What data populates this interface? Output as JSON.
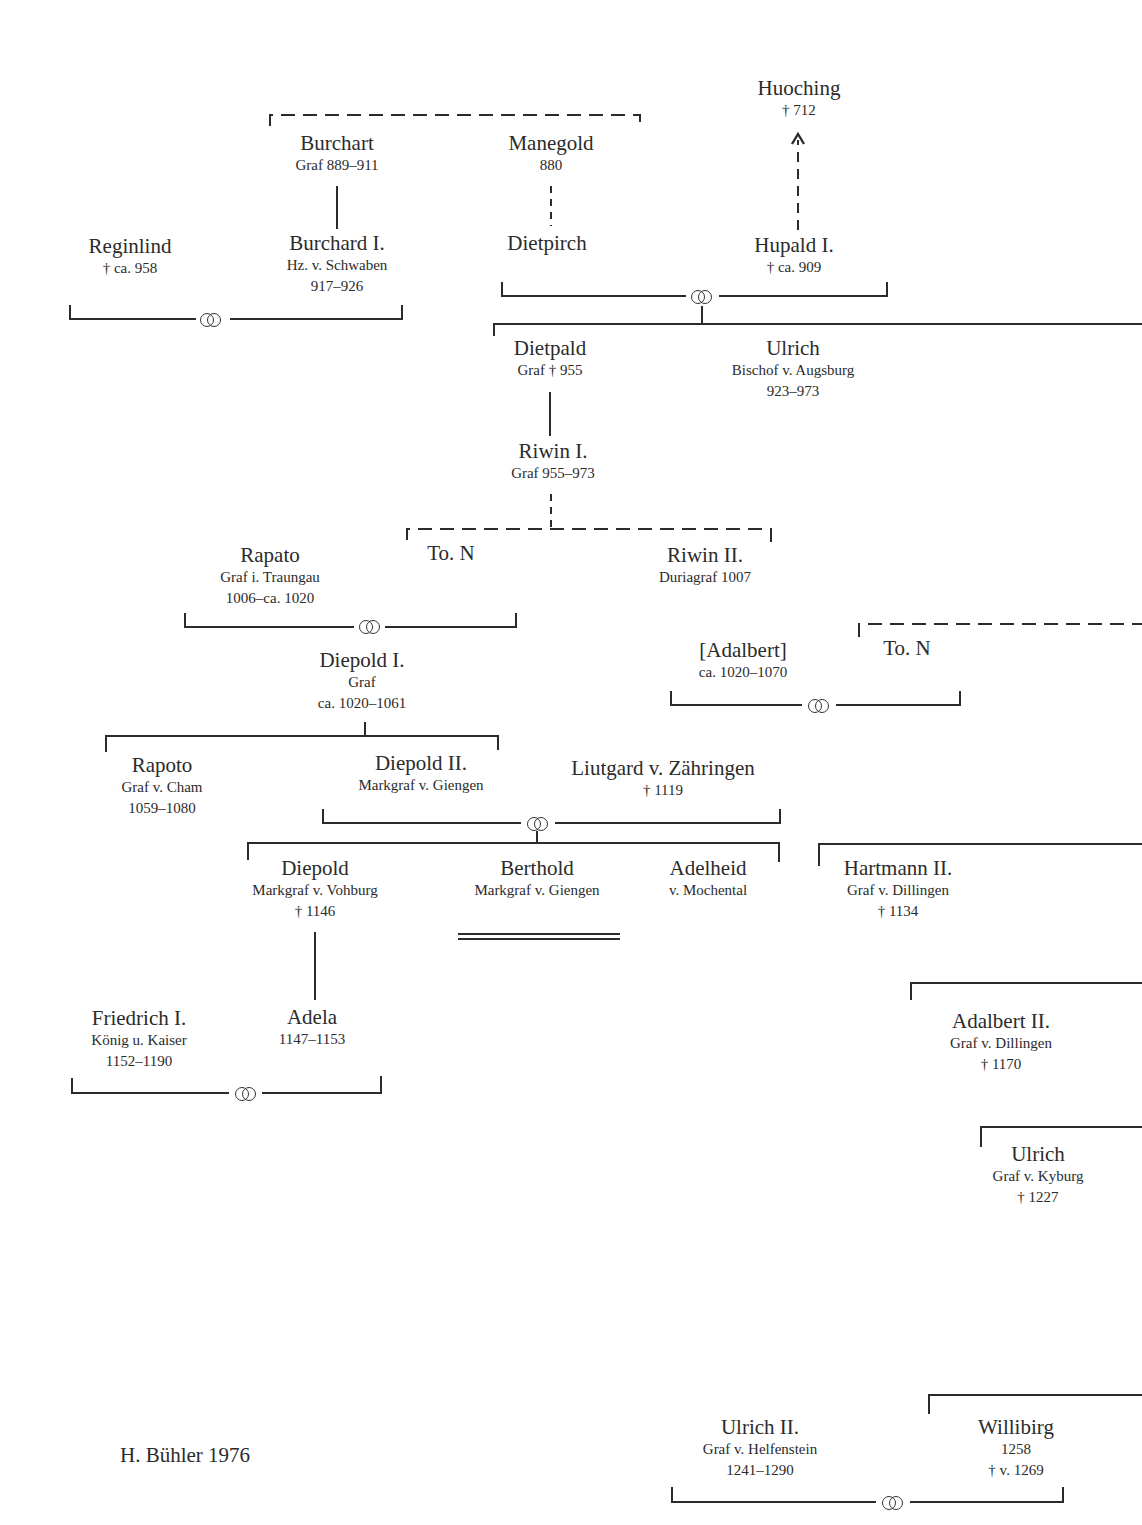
{
  "diagram": {
    "type": "genealogical-tree",
    "credit": "H. Bühler 1976",
    "colors": {
      "ink": "#2b2b2b",
      "background": "#ffffff"
    },
    "persons": [
      {
        "id": "huoching",
        "name": "Huoching",
        "lines": [
          "† 712"
        ],
        "x": 799,
        "y": 76
      },
      {
        "id": "burchart",
        "name": "Burchart",
        "lines": [
          "Graf 889–911"
        ],
        "x": 337,
        "y": 131
      },
      {
        "id": "manegold",
        "name": "Manegold",
        "lines": [
          "880"
        ],
        "x": 551,
        "y": 131
      },
      {
        "id": "reginlind",
        "name": "Reginlind",
        "lines": [
          "† ca. 958"
        ],
        "x": 130,
        "y": 234
      },
      {
        "id": "burchard-1",
        "name": "Burchard I.",
        "lines": [
          "Hz. v. Schwaben",
          "917–926"
        ],
        "x": 337,
        "y": 231
      },
      {
        "id": "dietpirch",
        "name": "Dietpirch",
        "lines": [],
        "x": 547,
        "y": 231
      },
      {
        "id": "hupald-1",
        "name": "Hupald I.",
        "lines": [
          "† ca. 909"
        ],
        "x": 794,
        "y": 233
      },
      {
        "id": "dietpald",
        "name": "Dietpald",
        "lines": [
          "Graf † 955"
        ],
        "x": 550,
        "y": 336
      },
      {
        "id": "ulrich-bischof",
        "name": "Ulrich",
        "lines": [
          "Bischof v. Augsburg",
          "923–973"
        ],
        "x": 793,
        "y": 336
      },
      {
        "id": "riwin-1",
        "name": "Riwin I.",
        "lines": [
          "Graf 955–973"
        ],
        "x": 553,
        "y": 439
      },
      {
        "id": "rapato",
        "name": "Rapato",
        "lines": [
          "Graf i. Traungau",
          "1006–ca. 1020"
        ],
        "x": 270,
        "y": 543
      },
      {
        "id": "to-n-1",
        "name": "To. N",
        "lines": [],
        "x": 451,
        "y": 541
      },
      {
        "id": "riwin-2",
        "name": "Riwin II.",
        "lines": [
          "Duriagraf 1007"
        ],
        "x": 705,
        "y": 543
      },
      {
        "id": "adalbert",
        "name": "[Adalbert]",
        "lines": [
          "ca. 1020–1070"
        ],
        "x": 743,
        "y": 638
      },
      {
        "id": "to-n-2",
        "name": "To. N",
        "lines": [],
        "x": 907,
        "y": 636
      },
      {
        "id": "diepold-1",
        "name": "Diepold I.",
        "lines": [
          "Graf",
          "ca. 1020–1061"
        ],
        "x": 362,
        "y": 648
      },
      {
        "id": "rapoto",
        "name": "Rapoto",
        "lines": [
          "Graf v. Cham",
          "1059–1080"
        ],
        "x": 162,
        "y": 753
      },
      {
        "id": "diepold-2",
        "name": "Diepold II.",
        "lines": [
          "Markgraf v. Giengen"
        ],
        "x": 421,
        "y": 751
      },
      {
        "id": "liutgard",
        "name": "Liutgard v. Zähringen",
        "lines": [
          "† 1119"
        ],
        "x": 663,
        "y": 756
      },
      {
        "id": "diepold-vohburg",
        "name": "Diepold",
        "lines": [
          "Markgraf v. Vohburg",
          "† 1146"
        ],
        "x": 315,
        "y": 856
      },
      {
        "id": "berthold",
        "name": "Berthold",
        "lines": [
          "Markgraf v. Giengen"
        ],
        "x": 537,
        "y": 856
      },
      {
        "id": "adelheid",
        "name": "Adelheid",
        "lines": [
          "v. Mochental"
        ],
        "x": 708,
        "y": 856
      },
      {
        "id": "hartmann-2",
        "name": "Hartmann II.",
        "lines": [
          "Graf v. Dillingen",
          "† 1134"
        ],
        "x": 898,
        "y": 856
      },
      {
        "id": "friedrich-1",
        "name": "Friedrich I.",
        "lines": [
          "König u. Kaiser",
          "1152–1190"
        ],
        "x": 139,
        "y": 1006
      },
      {
        "id": "adela",
        "name": "Adela",
        "lines": [
          "1147–1153"
        ],
        "x": 312,
        "y": 1005
      },
      {
        "id": "adalbert-2",
        "name": "Adalbert II.",
        "lines": [
          "Graf v. Dillingen",
          "† 1170"
        ],
        "x": 1001,
        "y": 1009
      },
      {
        "id": "ulrich-kyburg",
        "name": "Ulrich",
        "lines": [
          "Graf v. Kyburg",
          "† 1227"
        ],
        "x": 1038,
        "y": 1142
      },
      {
        "id": "ulrich-2",
        "name": "Ulrich II.",
        "lines": [
          "Graf v. Helfenstein",
          "1241–1290"
        ],
        "x": 760,
        "y": 1415
      },
      {
        "id": "willibirg",
        "name": "Willibirg",
        "lines": [
          "1258",
          "† v. 1269"
        ],
        "x": 1016,
        "y": 1415
      }
    ],
    "marriage_symbols": [
      {
        "between": [
          "reginlind",
          "burchard-1"
        ],
        "x": 211,
        "y": 320
      },
      {
        "between": [
          "dietpirch",
          "hupald-1"
        ],
        "x": 701,
        "y": 297
      },
      {
        "between": [
          "rapato",
          "to-n-1"
        ],
        "x": 369,
        "y": 626
      },
      {
        "between": [
          "adalbert",
          "to-n-2"
        ],
        "x": 818,
        "y": 706
      },
      {
        "between": [
          "diepold-2",
          "liutgard"
        ],
        "x": 537,
        "y": 823
      },
      {
        "between": [
          "friedrich-1",
          "adela"
        ],
        "x": 245,
        "y": 1093
      },
      {
        "between": [
          "ulrich-2",
          "willibirg"
        ],
        "x": 892,
        "y": 1502
      }
    ],
    "legend_notes": {
      "solid_line": "documented descent",
      "dashed_line": "presumed descent",
      "double_line": "line extinct",
      "rings_symbol": "marriage"
    }
  }
}
